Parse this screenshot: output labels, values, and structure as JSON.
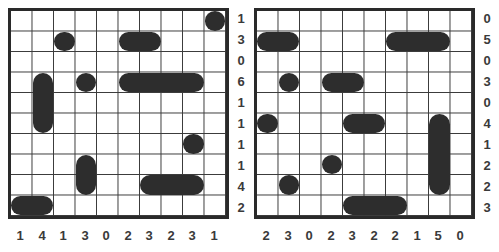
{
  "puzzles": [
    {
      "name": "left",
      "row_clues": [
        "1",
        "3",
        "0",
        "6",
        "1",
        "1",
        "1",
        "1",
        "4",
        "2"
      ],
      "col_clues": [
        "1",
        "4",
        "1",
        "3",
        "0",
        "2",
        "3",
        "2",
        "3",
        "1"
      ],
      "ships": [
        {
          "row": 0,
          "col": 9,
          "length": 1,
          "orientation": "h"
        },
        {
          "row": 1,
          "col": 2,
          "length": 1,
          "orientation": "h"
        },
        {
          "row": 1,
          "col": 5,
          "length": 2,
          "orientation": "h"
        },
        {
          "row": 3,
          "col": 1,
          "length": 3,
          "orientation": "v"
        },
        {
          "row": 3,
          "col": 3,
          "length": 1,
          "orientation": "h"
        },
        {
          "row": 3,
          "col": 5,
          "length": 4,
          "orientation": "h"
        },
        {
          "row": 6,
          "col": 8,
          "length": 1,
          "orientation": "h"
        },
        {
          "row": 7,
          "col": 3,
          "length": 2,
          "orientation": "v"
        },
        {
          "row": 8,
          "col": 6,
          "length": 3,
          "orientation": "h"
        },
        {
          "row": 9,
          "col": 0,
          "length": 2,
          "orientation": "h"
        }
      ]
    },
    {
      "name": "right",
      "row_clues": [
        "0",
        "5",
        "0",
        "3",
        "0",
        "4",
        "1",
        "2",
        "2",
        "3"
      ],
      "col_clues": [
        "2",
        "3",
        "0",
        "2",
        "3",
        "2",
        "2",
        "1",
        "5",
        "0"
      ],
      "ships": [
        {
          "row": 1,
          "col": 0,
          "length": 2,
          "orientation": "h"
        },
        {
          "row": 1,
          "col": 6,
          "length": 3,
          "orientation": "h"
        },
        {
          "row": 3,
          "col": 1,
          "length": 1,
          "orientation": "h"
        },
        {
          "row": 3,
          "col": 3,
          "length": 2,
          "orientation": "h"
        },
        {
          "row": 5,
          "col": 0,
          "length": 1,
          "orientation": "h"
        },
        {
          "row": 5,
          "col": 4,
          "length": 2,
          "orientation": "h"
        },
        {
          "row": 5,
          "col": 8,
          "length": 4,
          "orientation": "v"
        },
        {
          "row": 7,
          "col": 3,
          "length": 1,
          "orientation": "h"
        },
        {
          "row": 8,
          "col": 1,
          "length": 1,
          "orientation": "h"
        },
        {
          "row": 9,
          "col": 4,
          "length": 3,
          "orientation": "h"
        }
      ]
    }
  ],
  "colors": {
    "ship": "#2d2d2d",
    "grid_line": "#3a3a3a",
    "clue_text": "#3a3a3a",
    "background": "#ffffff"
  }
}
